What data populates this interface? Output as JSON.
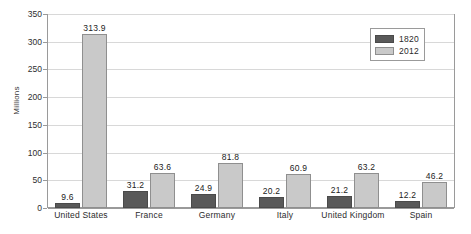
{
  "chart_data": {
    "type": "bar",
    "title": "",
    "subtitle": "",
    "xlabel": "",
    "ylabel": "Millions",
    "ylim": [
      0,
      350
    ],
    "ytick_step": 50,
    "yticks": [
      "350",
      "300",
      "250",
      "200",
      "150",
      "100",
      "50",
      "0"
    ],
    "grid": true,
    "legend_position": "top-right",
    "categories": [
      "United States",
      "France",
      "Germany",
      "Italy",
      "United Kingdom",
      "Spain"
    ],
    "series": [
      {
        "name": "1820",
        "color": "#595959",
        "values": [
          9.6,
          31.2,
          24.9,
          20.2,
          21.2,
          12.2
        ],
        "labels": [
          "9.6",
          "31.2",
          "24.9",
          "20.2",
          "21.2",
          "12.2"
        ]
      },
      {
        "name": "2012",
        "color": "#c9c9c9",
        "values": [
          313.9,
          63.6,
          81.8,
          60.9,
          63.2,
          46.2
        ],
        "labels": [
          "313.9",
          "63.6",
          "81.8",
          "60.9",
          "63.2",
          "46.2"
        ]
      }
    ]
  },
  "legend": {
    "items": [
      {
        "label": "1820",
        "swatch": "#595959"
      },
      {
        "label": "2012",
        "swatch": "#c9c9c9"
      }
    ]
  },
  "axis": {
    "y_title": "Millions"
  },
  "colors": {
    "series_1820": "#595959",
    "series_2012": "#c9c9c9",
    "gridline": "#d8d8d8",
    "frame": "#9a9a9a",
    "text": "#2b2b2b",
    "background": "#ffffff"
  }
}
